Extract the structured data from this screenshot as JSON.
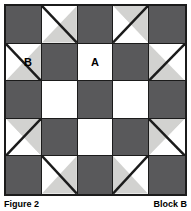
{
  "figure": {
    "caption_left": "Figure 2",
    "caption_right": "Block B"
  },
  "colors": {
    "dark": "#59595b",
    "light": "#d2d2d0",
    "white": "#ffffff",
    "seam": "#1b1b1b"
  },
  "block": {
    "rows": 5,
    "cols": 5,
    "labels": {
      "a": "A",
      "b": "B"
    },
    "cells": [
      {
        "id": "r1c1",
        "type": "solid",
        "fill": "dark",
        "label": ""
      },
      {
        "id": "r1c2",
        "type": "hst",
        "diagonal": "tl-br",
        "upper": "white",
        "lower": "light",
        "label": ""
      },
      {
        "id": "r1c3",
        "type": "solid",
        "fill": "dark",
        "label": ""
      },
      {
        "id": "r1c4",
        "type": "hst",
        "diagonal": "tr-bl",
        "upper": "light",
        "lower": "white",
        "label": ""
      },
      {
        "id": "r1c5",
        "type": "solid",
        "fill": "dark",
        "label": ""
      },
      {
        "id": "r2c1",
        "type": "hst",
        "diagonal": "tl-br",
        "upper": "white",
        "lower": "light",
        "label": "B"
      },
      {
        "id": "r2c2",
        "type": "solid",
        "fill": "dark",
        "label": ""
      },
      {
        "id": "r2c3",
        "type": "solid",
        "fill": "white",
        "label": "A"
      },
      {
        "id": "r2c4",
        "type": "solid",
        "fill": "dark",
        "label": ""
      },
      {
        "id": "r2c5",
        "type": "hst",
        "diagonal": "tr-bl",
        "upper": "white",
        "lower": "light",
        "label": ""
      },
      {
        "id": "r3c1",
        "type": "solid",
        "fill": "dark",
        "label": ""
      },
      {
        "id": "r3c2",
        "type": "solid",
        "fill": "white",
        "label": ""
      },
      {
        "id": "r3c3",
        "type": "solid",
        "fill": "dark",
        "label": ""
      },
      {
        "id": "r3c4",
        "type": "solid",
        "fill": "white",
        "label": ""
      },
      {
        "id": "r3c5",
        "type": "solid",
        "fill": "dark",
        "label": ""
      },
      {
        "id": "r4c1",
        "type": "hst",
        "diagonal": "tr-bl",
        "upper": "light",
        "lower": "white",
        "label": ""
      },
      {
        "id": "r4c2",
        "type": "solid",
        "fill": "dark",
        "label": ""
      },
      {
        "id": "r4c3",
        "type": "solid",
        "fill": "white",
        "label": ""
      },
      {
        "id": "r4c4",
        "type": "solid",
        "fill": "dark",
        "label": ""
      },
      {
        "id": "r4c5",
        "type": "hst",
        "diagonal": "tl-br",
        "upper": "light",
        "lower": "white",
        "label": ""
      },
      {
        "id": "r5c1",
        "type": "solid",
        "fill": "dark",
        "label": ""
      },
      {
        "id": "r5c2",
        "type": "hst",
        "diagonal": "tl-br",
        "upper": "white",
        "lower": "light",
        "label": ""
      },
      {
        "id": "r5c3",
        "type": "solid",
        "fill": "dark",
        "label": ""
      },
      {
        "id": "r5c4",
        "type": "hst",
        "diagonal": "tr-bl",
        "upper": "white",
        "lower": "light",
        "label": ""
      },
      {
        "id": "r5c5",
        "type": "solid",
        "fill": "dark",
        "label": ""
      }
    ]
  }
}
